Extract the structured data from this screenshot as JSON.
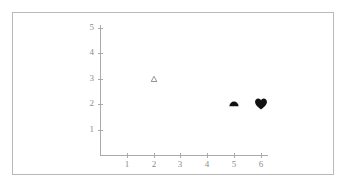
{
  "figure": {
    "background_color": "#ffffff",
    "frame_color": "#b9b9b9",
    "axis_color": "#a9a9a9",
    "label_color": "#8d8d8d",
    "marker_color": "#111111"
  },
  "chart_data": {
    "type": "scatter",
    "title": "",
    "xlabel": "",
    "ylabel": "",
    "xlim": [
      0,
      6.6
    ],
    "ylim": [
      0,
      5.3
    ],
    "xticks": [
      "1",
      "2",
      "3",
      "4",
      "5",
      "6"
    ],
    "yticks": [
      "1",
      "2",
      "3",
      "4",
      "5"
    ],
    "grid": false,
    "legend": null,
    "points": [
      {
        "x": 2,
        "y": 3,
        "marker": "triangle-up-open",
        "filled": false,
        "color": "#555555",
        "size": 7
      },
      {
        "x": 5,
        "y": 2,
        "marker": "semicircle-filled",
        "filled": true,
        "color": "#111111",
        "size": 11
      },
      {
        "x": 6,
        "y": 2,
        "marker": "heart-filled",
        "filled": true,
        "color": "#111111",
        "size": 14
      }
    ]
  }
}
